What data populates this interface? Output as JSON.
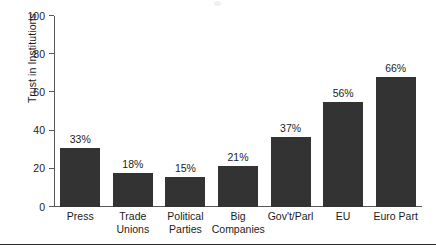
{
  "chart_data": {
    "type": "bar",
    "title": "",
    "subtitle": "",
    "xlabel": "",
    "ylabel": "Trust in Institutions",
    "ylim": [
      0,
      100
    ],
    "yticks": [
      0,
      20,
      40,
      60,
      80,
      100
    ],
    "ytick_labels": [
      "0",
      "20",
      "40",
      "60",
      "80",
      "100"
    ],
    "grid": false,
    "legend": null,
    "legend_position": "none",
    "categories": [
      "Press",
      "Trade Unions",
      "Political Parties",
      "Big Companies",
      "Gov't/Parl",
      "EU",
      "Euro Part"
    ],
    "category_lines": [
      [
        "Press"
      ],
      [
        "Trade",
        "Unions"
      ],
      [
        "Political",
        "Parties"
      ],
      [
        "Big",
        "Companies"
      ],
      [
        "Gov't/Parl"
      ],
      [
        "EU"
      ],
      [
        "Euro Part"
      ]
    ],
    "values": [
      33,
      18,
      15,
      21,
      37,
      56,
      66
    ],
    "bar_heights": [
      31,
      18,
      15.5,
      21.5,
      36.5,
      55,
      68
    ],
    "data_labels": [
      "33%",
      "18%",
      "15%",
      "21%",
      "37%",
      "56%",
      "66%"
    ],
    "bar_color": "#333333",
    "axis_color": "#55595c",
    "text_color": "#1c1c1c",
    "background_color": "#ffffff"
  },
  "figure": {
    "bottom_rule_color": "#2b2b2b"
  }
}
